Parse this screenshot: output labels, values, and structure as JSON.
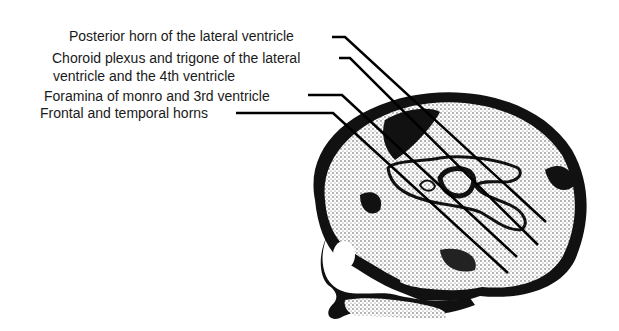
{
  "diagram": {
    "labels": [
      {
        "id": "posterior-horn",
        "lines": [
          "Posterior horn of the lateral ventricle"
        ]
      },
      {
        "id": "choroid-plexus",
        "lines": [
          "Choroid plexus and trigone of the lateral",
          "ventricle and the 4th ventricle"
        ]
      },
      {
        "id": "foramina-monro",
        "lines": [
          "Foramina of monro and 3rd ventricle"
        ]
      },
      {
        "id": "frontal-temporal-horns",
        "lines": [
          "Frontal and temporal horns"
        ]
      }
    ]
  }
}
